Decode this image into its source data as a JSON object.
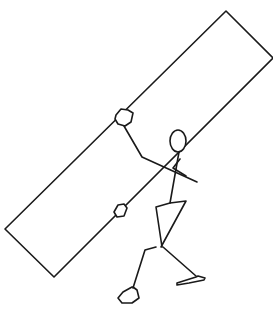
{
  "drawing": {
    "description": "Hand-drawn stick figure carrying a long tilted rectangular board",
    "stroke_color": "#1a1a1a",
    "background_color": "#ffffff",
    "board": {
      "points": "226,11 273,58 54,277 5,229"
    },
    "hands": [
      {
        "name": "upper-hand",
        "points": "116,115 121,109 128,110 133,113 131,122 125,126 118,124 115,119"
      },
      {
        "name": "lower-hand",
        "points": "114,212 118,205 124,204 127,208 124,216 117,217"
      }
    ],
    "head": {
      "cx": 178,
      "cy": 141,
      "rx": 8,
      "ry": 11
    },
    "arms": [
      {
        "name": "arm-upper",
        "points": "124,126 142,157 197,182"
      },
      {
        "name": "arm-cross",
        "points": "180,159 173,168 186,176"
      }
    ],
    "body": {
      "points": "179,152 170,203 186,201 161,247"
    },
    "torso_back": {
      "points": "170,203 156,207 162,247"
    },
    "legs": [
      {
        "name": "left-leg",
        "points": "156,247 145,250 133,288"
      },
      {
        "name": "right-leg",
        "points": "163,247 196,276"
      }
    ],
    "feet": [
      {
        "name": "left-foot",
        "points": "133,287 137,290 139,298 132,303 122,303 118,298 123,292 132,287"
      },
      {
        "name": "right-foot",
        "points": "177,283 196,277 198,276 205,278 204,280 189,283 177,285"
      }
    ]
  }
}
